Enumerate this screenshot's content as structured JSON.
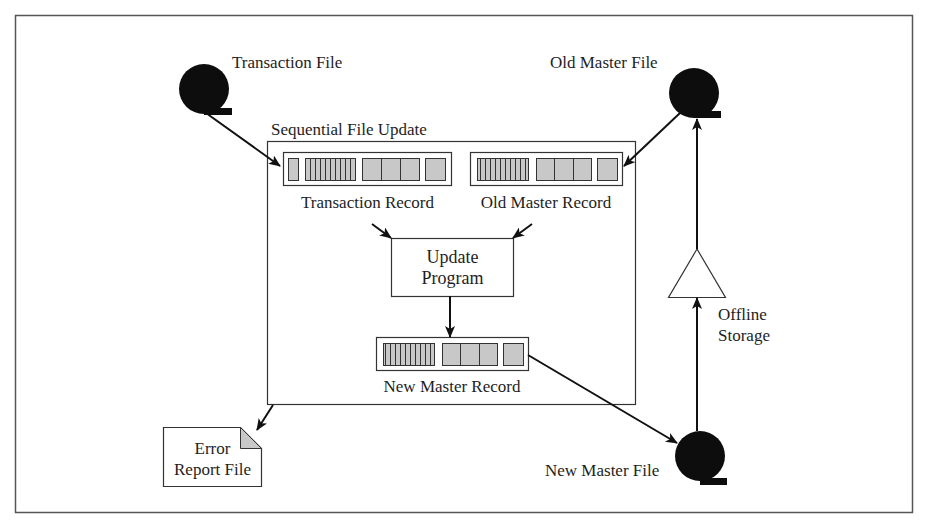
{
  "diagram": {
    "title": "Sequential File Update",
    "colors": {
      "line": "#2a2a2a",
      "disk": "#0d0d0d",
      "field_fill": "#c8c8c8",
      "background": "#ffffff"
    },
    "files": {
      "transaction": {
        "label": "Transaction File",
        "icon": "tape-disk-icon"
      },
      "old_master": {
        "label": "Old Master File",
        "icon": "tape-disk-icon"
      },
      "new_master": {
        "label": "New Master File",
        "icon": "tape-disk-icon"
      }
    },
    "records": {
      "transaction": {
        "label": "Transaction Record"
      },
      "old_master": {
        "label": "Old Master Record"
      },
      "new_master": {
        "label": "New Master Record"
      }
    },
    "process": {
      "line1": "Update",
      "line2": "Program"
    },
    "offline_storage": {
      "line1": "Offline",
      "line2": "Storage",
      "icon": "triangle-storage-icon"
    },
    "error_report": {
      "line1": "Error",
      "line2": "Report File",
      "icon": "document-icon"
    },
    "flows": [
      {
        "from": "Transaction File",
        "to": "Transaction Record"
      },
      {
        "from": "Old Master File",
        "to": "Old Master Record"
      },
      {
        "from": "Transaction Record",
        "to": "Update Program"
      },
      {
        "from": "Old Master Record",
        "to": "Update Program"
      },
      {
        "from": "Update Program",
        "to": "New Master Record"
      },
      {
        "from": "New Master Record",
        "to": "New Master File"
      },
      {
        "from": "Sequential File Update",
        "to": "Error Report File"
      },
      {
        "from": "New Master File",
        "to": "Offline Storage"
      },
      {
        "from": "Offline Storage",
        "to": "Old Master File"
      }
    ]
  }
}
